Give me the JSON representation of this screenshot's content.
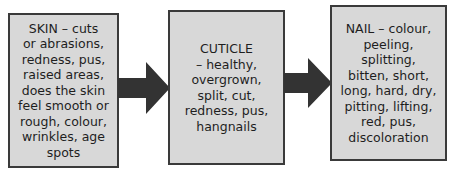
{
  "diagram": {
    "type": "flow",
    "colors": {
      "box_fill": "#d8d8d8",
      "box_border": "#3a3a3a",
      "arrow": "#333333"
    },
    "boxes": [
      {
        "id": "skin",
        "text": "SKIN – cuts\nor abrasions,\nredness, pus,\nraised areas,\ndoes the skin\nfeel smooth or\nrough, colour,\nwrinkles, age\nspots"
      },
      {
        "id": "cuticle",
        "text": "CUTICLE\n– healthy,\novergrown,\nsplit, cut,\nredness, pus,\nhangnails"
      },
      {
        "id": "nail",
        "text": "NAIL – colour,\npeeling,\nsplitting,\nbitten, short,\nlong, hard, dry,\npitting, lifting,\nred, pus,\ndiscoloration"
      }
    ],
    "arrows": [
      {
        "from": "skin",
        "to": "cuticle"
      },
      {
        "from": "cuticle",
        "to": "nail"
      }
    ]
  }
}
